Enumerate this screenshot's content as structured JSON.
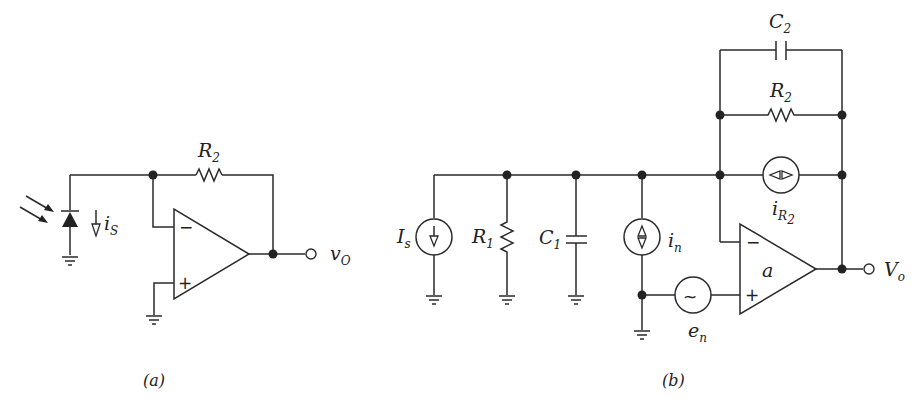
{
  "figure_a": {
    "caption": "(a)",
    "feedback_resistor": {
      "label": "R",
      "sub": "2"
    },
    "photodiode_current": {
      "label": "i",
      "sub": "S"
    },
    "output": {
      "label": "v",
      "sub": "O"
    },
    "opamp": {
      "minus": "−",
      "plus": "+"
    }
  },
  "figure_b": {
    "caption": "(b)",
    "signal_source": {
      "label": "I",
      "sub": "s"
    },
    "input_resistor": {
      "label": "R",
      "sub": "1"
    },
    "input_capacitor": {
      "label": "C",
      "sub": "1"
    },
    "noise_current": {
      "label": "i",
      "sub": "n"
    },
    "noise_voltage": {
      "label": "e",
      "sub": "n",
      "glyph": "~"
    },
    "feedback_capacitor": {
      "label": "C",
      "sub": "2"
    },
    "feedback_resistor": {
      "label": "R",
      "sub": "2"
    },
    "resistor_noise_current": {
      "label": "i",
      "sub": "R",
      "subsub": "2"
    },
    "opamp": {
      "gain_label": "a",
      "minus": "−",
      "plus": "+"
    },
    "output": {
      "label": "V",
      "sub": "o"
    }
  }
}
